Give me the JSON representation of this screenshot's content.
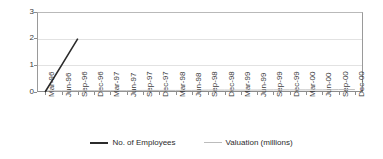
{
  "chart_data": {
    "type": "line",
    "title": "",
    "xlabel": "",
    "ylabel": "",
    "ylim": [
      0,
      3
    ],
    "yticks": [
      0,
      1,
      2,
      3
    ],
    "grid": true,
    "legend_position": "bottom",
    "categories": [
      "Mar-96",
      "Jun-96",
      "Sep-96",
      "Dec-96",
      "Mar-97",
      "Jun-97",
      "Sep-97",
      "Dec-97",
      "Mar-98",
      "Jun-98",
      "Sep-98",
      "Dec-98",
      "Mar-99",
      "Jun-99",
      "Sep-99",
      "Dec-99",
      "Mar-00",
      "Jun-00",
      "Sep-00",
      "Dec-00"
    ],
    "series": [
      {
        "name": "No. of Employees",
        "color": "#2b2b2b",
        "values": [
          0,
          1,
          2,
          null,
          null,
          null,
          null,
          null,
          null,
          null,
          null,
          null,
          null,
          null,
          null,
          null,
          null,
          null,
          null,
          null
        ]
      },
      {
        "name": "Valuation (millions)",
        "color": "#bcbcbc",
        "values": [
          0.04,
          0.04,
          0.05,
          0.05,
          0.05,
          0.05,
          0.06,
          0.06,
          0.06,
          0.06,
          0.07,
          0.07,
          0.07,
          0.07,
          0.08,
          0.08,
          0.08,
          0.08,
          0.09,
          0.09
        ]
      }
    ]
  },
  "yaxis": {
    "ticks": [
      {
        "label": "3"
      },
      {
        "label": "2"
      },
      {
        "label": "1"
      },
      {
        "label": "0"
      }
    ]
  },
  "xaxis": {
    "ticks": [
      {
        "label": "Mar-96"
      },
      {
        "label": "Jun-96"
      },
      {
        "label": "Sep-96"
      },
      {
        "label": "Dec-96"
      },
      {
        "label": "Mar-97"
      },
      {
        "label": "Jun-97"
      },
      {
        "label": "Sep-97"
      },
      {
        "label": "Dec-97"
      },
      {
        "label": "Mar-98"
      },
      {
        "label": "Jun-98"
      },
      {
        "label": "Sep-98"
      },
      {
        "label": "Dec-98"
      },
      {
        "label": "Mar-99"
      },
      {
        "label": "Jun-99"
      },
      {
        "label": "Sep-99"
      },
      {
        "label": "Dec-99"
      },
      {
        "label": "Mar-00"
      },
      {
        "label": "Jun-00"
      },
      {
        "label": "Sep-00"
      },
      {
        "label": "Dec-00"
      }
    ]
  },
  "legend": {
    "items": [
      {
        "label": "No. of Employees",
        "color": "#2b2b2b"
      },
      {
        "label": "Valuation (millions)",
        "color": "#bcbcbc"
      }
    ]
  }
}
